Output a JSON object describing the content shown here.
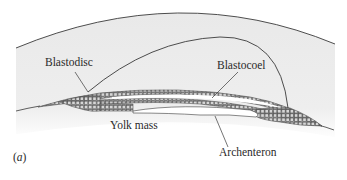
{
  "figure": {
    "panel_label": "(a)",
    "panel_letter": "a"
  },
  "labels": {
    "blastodisc": "Blastodisc",
    "blastocoel": "Blastocoel",
    "yolk_mass": "Yolk mass",
    "archenteron": "Archenteron"
  },
  "colors": {
    "background": "#ffffff",
    "yolk_fill": "#ececec",
    "line": "#3a3a3a",
    "cell_fill": "#d4d4d4",
    "cell_stroke": "#555555",
    "cavity_fill": "#ffffff"
  }
}
